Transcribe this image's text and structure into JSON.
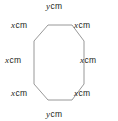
{
  "figure": {
    "name": "octagon-with-labeled-sides",
    "shape": "octagon",
    "stroke_color": "#8c8c8c",
    "fill_color": "#ffffff",
    "text_color": "#231f20",
    "labels": {
      "top": {
        "variable": "y",
        "unit": "cm"
      },
      "top_left": {
        "variable": "x",
        "unit": "cm"
      },
      "top_right": {
        "variable": "x",
        "unit": "cm"
      },
      "middle_left": {
        "variable": "x",
        "unit": "cm"
      },
      "middle_right": {
        "variable": "x",
        "unit": "cm"
      },
      "bottom_left": {
        "variable": "x",
        "unit": "cm"
      },
      "bottom_right": {
        "variable": "x",
        "unit": "cm"
      },
      "bottom": {
        "variable": "y",
        "unit": "cm"
      }
    },
    "vertices": [
      [
        48,
        25
      ],
      [
        72,
        25
      ],
      [
        84,
        41
      ],
      [
        84,
        84
      ],
      [
        72,
        100
      ],
      [
        48,
        100
      ],
      [
        34,
        84
      ],
      [
        34,
        41
      ]
    ]
  }
}
